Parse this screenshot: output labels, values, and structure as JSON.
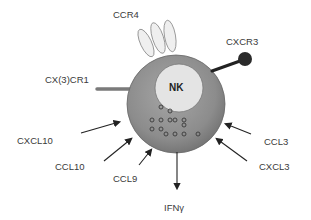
{
  "diagram": {
    "cell_label": "NK",
    "receptors": [
      {
        "name": "CCR4",
        "shape": "ellipse-cluster"
      },
      {
        "name": "CXCR3",
        "shape": "ball-stick"
      },
      {
        "name": "CX(3)CR1",
        "shape": "rod"
      }
    ],
    "inputs": [
      "CXCL10",
      "CCL10",
      "CCL9",
      "CCL3",
      "CXCL3"
    ],
    "output": "IFNγ",
    "colors": {
      "cell_body": "#8a8a8a",
      "nucleus": "#e4e4e4",
      "receptor_ellipse": "#efefef",
      "arrow": "#222222",
      "text": "#3a3a3a"
    }
  }
}
